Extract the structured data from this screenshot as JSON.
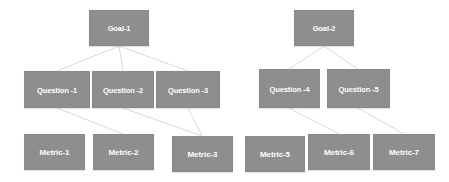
{
  "diagram": {
    "type": "gqm-tree",
    "background_color": "#ffffff",
    "node_fill_color": "#8e8e8e",
    "node_text_color": "#ffffff",
    "connector_color": "#d9d9d9",
    "levels": [
      "Goal",
      "Question",
      "Metric"
    ],
    "nodes": [
      {
        "id": "goal-1",
        "label": "Goal-1",
        "level": "goal",
        "x": 89,
        "y": 10,
        "w": 60,
        "h": 36
      },
      {
        "id": "goal-2",
        "label": "Goal-2",
        "level": "goal",
        "x": 294,
        "y": 10,
        "w": 60,
        "h": 36
      },
      {
        "id": "question-1",
        "label": "Question -1",
        "level": "question",
        "x": 24,
        "y": 71,
        "w": 66,
        "h": 37
      },
      {
        "id": "question-2",
        "label": "Question -2",
        "level": "question",
        "x": 92,
        "y": 71,
        "w": 62,
        "h": 37
      },
      {
        "id": "question-3",
        "label": "Question -3",
        "level": "question",
        "x": 156,
        "y": 71,
        "w": 64,
        "h": 37
      },
      {
        "id": "question-4",
        "label": "Question -4",
        "level": "question",
        "x": 259,
        "y": 69,
        "w": 61,
        "h": 39
      },
      {
        "id": "question-5",
        "label": "Question -5",
        "level": "question",
        "x": 327,
        "y": 69,
        "w": 63,
        "h": 39
      },
      {
        "id": "metric-1",
        "label": "Metric-1",
        "level": "metric",
        "x": 24,
        "y": 134,
        "w": 61,
        "h": 36
      },
      {
        "id": "metric-2",
        "label": "Metric-2",
        "level": "metric",
        "x": 93,
        "y": 134,
        "w": 61,
        "h": 36
      },
      {
        "id": "metric-3",
        "label": "Metric-3",
        "level": "metric",
        "x": 172,
        "y": 136,
        "w": 61,
        "h": 36
      },
      {
        "id": "metric-5",
        "label": "Metric-5",
        "level": "metric",
        "x": 245,
        "y": 136,
        "w": 60,
        "h": 36
      },
      {
        "id": "metric-6",
        "label": "Metric-6",
        "level": "metric",
        "x": 308,
        "y": 134,
        "w": 62,
        "h": 36
      },
      {
        "id": "metric-7",
        "label": "Metric-7",
        "level": "metric",
        "x": 373,
        "y": 134,
        "w": 62,
        "h": 36
      }
    ],
    "edges": [
      {
        "id": "edge-goal1-question1",
        "from": "goal-1",
        "to": "question-1",
        "x1": 119,
        "y1": 46,
        "x2": 57,
        "y2": 71
      },
      {
        "id": "edge-goal1-question2",
        "from": "goal-1",
        "to": "question-2",
        "x1": 119,
        "y1": 46,
        "x2": 123,
        "y2": 71
      },
      {
        "id": "edge-goal1-question3",
        "from": "goal-1",
        "to": "question-3",
        "x1": 119,
        "y1": 46,
        "x2": 188,
        "y2": 71
      },
      {
        "id": "edge-goal2-question4",
        "from": "goal-2",
        "to": "question-4",
        "x1": 324,
        "y1": 46,
        "x2": 289,
        "y2": 69
      },
      {
        "id": "edge-goal2-question5",
        "from": "goal-2",
        "to": "question-5",
        "x1": 324,
        "y1": 46,
        "x2": 358,
        "y2": 69
      },
      {
        "id": "edge-question1-metric2",
        "from": "question-1",
        "to": "metric-2",
        "x1": 57,
        "y1": 108,
        "x2": 123,
        "y2": 134
      },
      {
        "id": "edge-question2-metric3",
        "from": "question-2",
        "to": "metric-3",
        "x1": 123,
        "y1": 108,
        "x2": 202,
        "y2": 136
      },
      {
        "id": "edge-question3-metric3",
        "from": "question-3",
        "to": "metric-3",
        "x1": 188,
        "y1": 108,
        "x2": 202,
        "y2": 136
      },
      {
        "id": "edge-question4-metric6",
        "from": "question-4",
        "to": "metric-6",
        "x1": 289,
        "y1": 108,
        "x2": 339,
        "y2": 134
      },
      {
        "id": "edge-question5-metric7",
        "from": "question-5",
        "to": "metric-7",
        "x1": 358,
        "y1": 108,
        "x2": 404,
        "y2": 134
      }
    ]
  }
}
